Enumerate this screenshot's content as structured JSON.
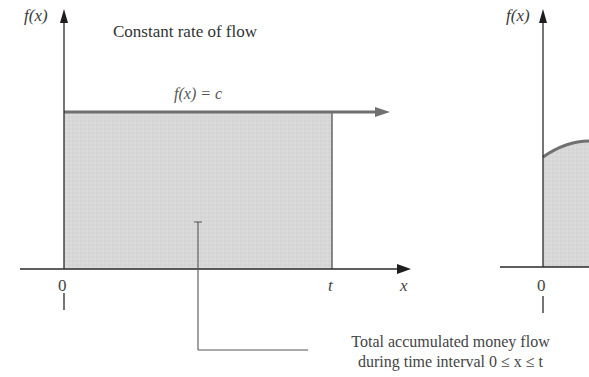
{
  "left_graph": {
    "y_axis_label": "f(x)",
    "title": "Constant rate of flow",
    "function_label": "f(x) = c",
    "x_axis_label": "x",
    "x_ticks": [
      "0",
      "t"
    ]
  },
  "annotation": {
    "line1": "Total accumulated money flow",
    "line2": "during time interval 0 ≤ x ≤ t"
  },
  "right_graph": {
    "y_axis_label": "f(x)",
    "x_ticks": [
      "0"
    ]
  },
  "colors": {
    "axis": "#2a2a2a",
    "function_line": "#6e6e6e",
    "shaded_area": "#d9d9d9",
    "border": "#555555"
  }
}
